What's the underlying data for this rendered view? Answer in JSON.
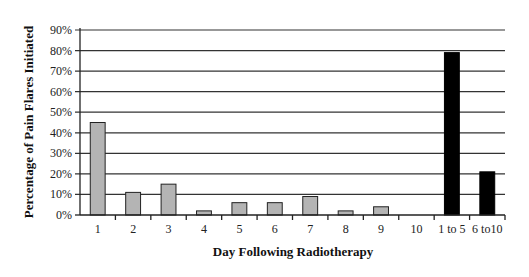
{
  "chart_data": {
    "type": "bar",
    "title": "",
    "xlabel": "Day Following Radiotherapy",
    "ylabel": "Percentage of Pain Flares Initiated",
    "ylim": [
      0,
      90
    ],
    "yticks": [
      "0%",
      "10%",
      "20%",
      "30%",
      "40%",
      "50%",
      "60%",
      "70%",
      "80%",
      "90%"
    ],
    "ytick_values": [
      0,
      10,
      20,
      30,
      40,
      50,
      60,
      70,
      80,
      90
    ],
    "grid": true,
    "legend": "none",
    "categories": [
      "1",
      "2",
      "3",
      "4",
      "5",
      "6",
      "7",
      "8",
      "9",
      "10",
      "1 to 5",
      "6 to10"
    ],
    "values": [
      45,
      11,
      15,
      2,
      6,
      6,
      9,
      2,
      4,
      0,
      79,
      21
    ],
    "bar_colors": [
      "#b4b4b4",
      "#b4b4b4",
      "#b4b4b4",
      "#b4b4b4",
      "#b4b4b4",
      "#b4b4b4",
      "#b4b4b4",
      "#b4b4b4",
      "#b4b4b4",
      "#b4b4b4",
      "#000000",
      "#000000"
    ]
  }
}
